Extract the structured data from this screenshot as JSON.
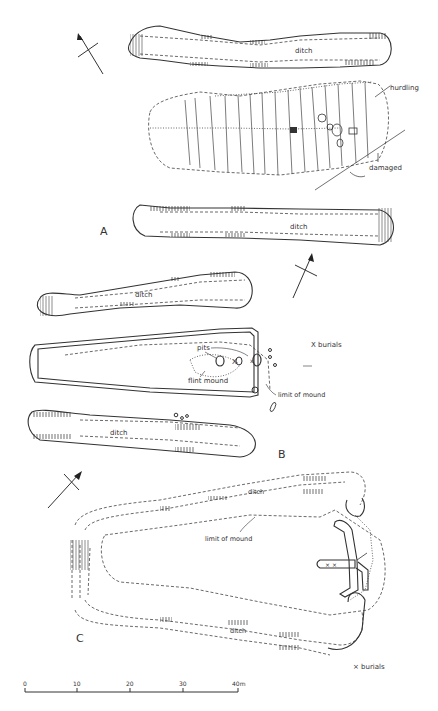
{
  "figure": {
    "panels": [
      {
        "id": "A",
        "letter": "A",
        "labels": {
          "ditch_top": "ditch",
          "ditch_bottom": "ditch",
          "hurdling": "hurdling",
          "damaged": "damaged"
        }
      },
      {
        "id": "B",
        "letter": "B",
        "labels": {
          "ditch_top": "ditch",
          "ditch_bottom": "ditch",
          "pits": "pits",
          "flint_mound": "flint mound",
          "limit_of_mound": "limit of mound",
          "burials_legend": "X burials"
        }
      },
      {
        "id": "C",
        "letter": "C",
        "labels": {
          "ditch_top": "ditch",
          "ditch_bottom": "ditch",
          "limit_of_mound": "limit of mound",
          "burials_legend": "× burials"
        }
      }
    ],
    "scale_bar": {
      "ticks": [
        "0",
        "10",
        "20",
        "30",
        "40m"
      ],
      "unit": "m"
    },
    "north_arrows": [
      "north-arrow-a",
      "north-arrow-b",
      "north-arrow-c"
    ]
  }
}
